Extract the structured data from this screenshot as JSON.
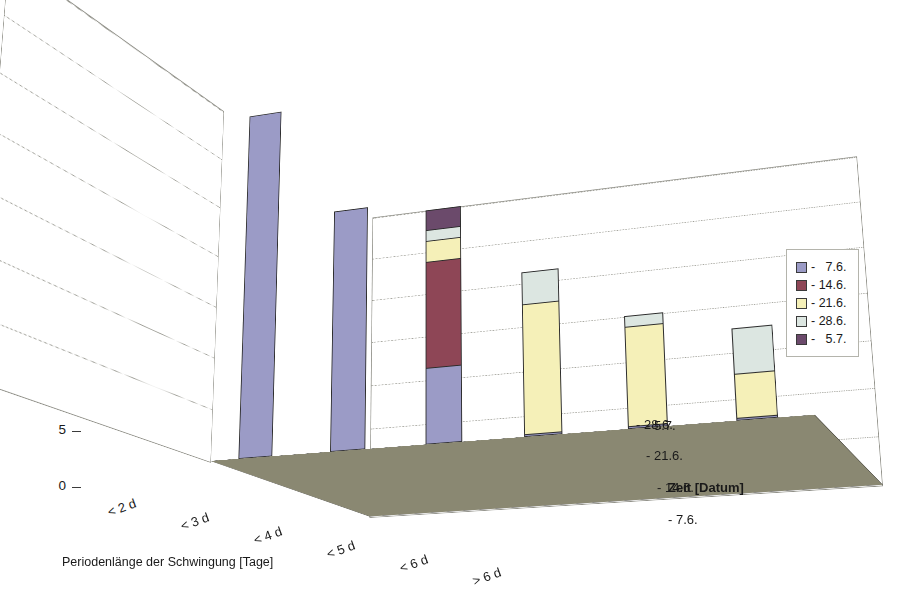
{
  "chart_data": {
    "type": "bar",
    "subtype": "3d-grouped-bar",
    "title": "",
    "xlabel": "Periodenlänge der Schwingung [Tage]",
    "ylabel": "Anzahl der Gabelsprosse",
    "zlabel": "Zeit [Datum]",
    "categories": [
      "< 2 d",
      "< 3 d",
      "< 4 d",
      "< 5 d",
      "< 6 d",
      "> 6 d"
    ],
    "yticks": [
      0,
      5,
      10,
      15,
      20,
      25,
      30,
      35
    ],
    "ylim": [
      0,
      35
    ],
    "grid": true,
    "legend_position": "right",
    "zticks": [
      "- 7.6.",
      "- 14.6.",
      "- 21.6.",
      "- 28.6.",
      "- 5.7."
    ],
    "series": [
      {
        "name": "-   7.6.",
        "color": "#9b9bc6",
        "values": [
          34,
          23,
          7,
          0,
          0,
          0
        ]
      },
      {
        "name": "- 14.6.",
        "color": "#8e4656",
        "values": [
          9,
          21,
          17,
          0,
          0,
          0
        ]
      },
      {
        "name": "- 21.6.",
        "color": "#f5f0b8",
        "values": [
          0,
          14,
          19,
          12,
          9,
          4
        ]
      },
      {
        "name": "- 28.6.",
        "color": "#dce6e1",
        "values": [
          0,
          0,
          20,
          15,
          10,
          8
        ]
      },
      {
        "name": "-   5.7.",
        "color": "#6b4a6b",
        "values": [
          0,
          0,
          22,
          12,
          9,
          0
        ]
      }
    ]
  },
  "legend": {
    "items": [
      {
        "label": "-   7.6.",
        "color": "#9b9bc6"
      },
      {
        "label": "- 14.6.",
        "color": "#8e4656"
      },
      {
        "label": "- 21.6.",
        "color": "#f5f0b8"
      },
      {
        "label": "- 28.6.",
        "color": "#dce6e1"
      },
      {
        "label": "-   5.7.",
        "color": "#6b4a6b"
      }
    ]
  },
  "colors": {
    "floor": "#8a8872",
    "wall": "#ffffff",
    "gridline": "#9b9b93",
    "axis": "#3b3b3b",
    "background": "#ffffff"
  }
}
